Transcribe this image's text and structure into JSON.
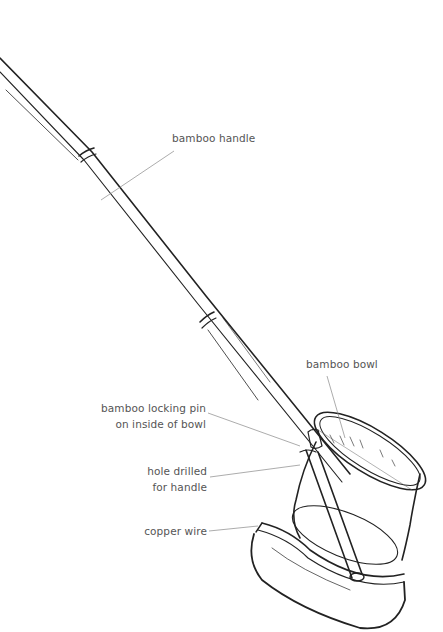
{
  "diagram": {
    "labels": {
      "handle": "bamboo handle",
      "bowl": "bamboo bowl",
      "pin_line1": "bamboo locking pin",
      "pin_line2": "on inside of bowl",
      "hole_line1": "hole drilled",
      "hole_line2": "for handle",
      "wire": "copper wire"
    },
    "colors": {
      "ink": "#222222",
      "leader": "#888888",
      "label_text": "#555555",
      "background": "#ffffff"
    }
  }
}
